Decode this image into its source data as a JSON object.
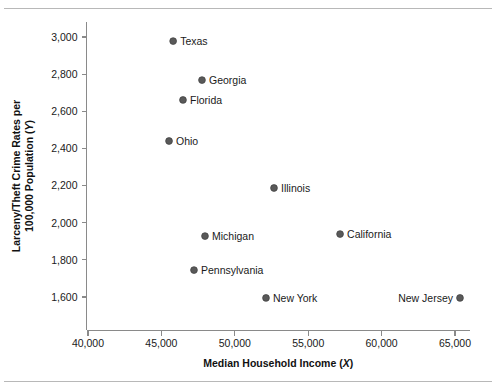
{
  "chart_data": {
    "type": "scatter",
    "title": "",
    "xlabel": "Median Household Income (X)",
    "xlabel_main": "Median Household Income (",
    "xlabel_var": "X",
    "xlabel_tail": ")",
    "ylabel": "Larceny/Theft Crime Rates per 100,000 Population (Y)",
    "ylabel_line1": "Larceny/Theft Crime Rates per",
    "ylabel_line2_main": "100,000 Population (",
    "ylabel_line2_var": "Y",
    "ylabel_line2_tail": ")",
    "xlim": [
      38600,
      66500
    ],
    "ylim": [
      1480,
      3080
    ],
    "xticks": [
      40000,
      45000,
      50000,
      55000,
      60000,
      65000
    ],
    "xticklabels": [
      "40,000",
      "45,000",
      "50,000",
      "55,000",
      "60,000",
      "65,000"
    ],
    "yticks": [
      1600,
      1800,
      2000,
      2200,
      2400,
      2600,
      2800,
      3000
    ],
    "yticklabels": [
      "1,600",
      "1,800",
      "2,000",
      "2,200",
      "2,400",
      "2,600",
      "2,800",
      "3,000"
    ],
    "grid": false,
    "legend": "none",
    "marker_color": "#595959",
    "axis_color": "#8a8a8a",
    "points": [
      {
        "label": "Texas",
        "x": 45800,
        "y": 2978,
        "label_side": "right"
      },
      {
        "label": "Georgia",
        "x": 47765,
        "y": 2768,
        "label_side": "right"
      },
      {
        "label": "Florida",
        "x": 46470,
        "y": 2661,
        "label_side": "right"
      },
      {
        "label": "Ohio",
        "x": 45520,
        "y": 2440,
        "label_side": "right"
      },
      {
        "label": "Illinois",
        "x": 52670,
        "y": 2187,
        "label_side": "right"
      },
      {
        "label": "California",
        "x": 57170,
        "y": 1939,
        "label_side": "right"
      },
      {
        "label": "Michigan",
        "x": 47970,
        "y": 1928,
        "label_side": "right"
      },
      {
        "label": "Pennsylvania",
        "x": 47220,
        "y": 1745,
        "label_side": "right"
      },
      {
        "label": "New York",
        "x": 52125,
        "y": 1595,
        "label_side": "right"
      },
      {
        "label": "New Jersey",
        "x": 65340,
        "y": 1595,
        "label_side": "left"
      }
    ]
  }
}
